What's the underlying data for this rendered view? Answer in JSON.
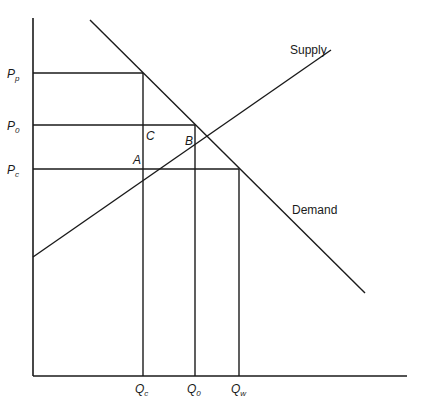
{
  "diagram": {
    "type": "supply-demand price control diagram",
    "curves": {
      "supply": {
        "label": "Supply",
        "from": [
          33,
          257
        ],
        "to": [
          331,
          50
        ]
      },
      "demand": {
        "label": "Demand",
        "from": [
          90,
          20
        ],
        "to": [
          365,
          293
        ]
      }
    },
    "axes": {
      "origin": [
        33,
        376
      ],
      "y_top": 18,
      "x_right": 407
    },
    "price_labels": [
      {
        "id": "Pp",
        "main": "P",
        "sub": "p",
        "y": 73
      },
      {
        "id": "P0",
        "main": "P",
        "sub": "0",
        "y": 125
      },
      {
        "id": "Pc",
        "main": "P",
        "sub": "c",
        "y": 169
      }
    ],
    "quantity_labels": [
      {
        "id": "Qc",
        "main": "Q",
        "sub": "c",
        "x": 143
      },
      {
        "id": "Q0",
        "main": "Q",
        "sub": "0",
        "x": 195
      },
      {
        "id": "Qw",
        "main": "Q",
        "sub": "w",
        "x": 239
      }
    ],
    "region_labels": {
      "A": "A",
      "B": "B",
      "C": "C"
    },
    "supply_label": "Supply",
    "demand_label": "Demand",
    "points": {
      "equilibrium": [
        195,
        125
      ],
      "supply_at_Pc": [
        143,
        169
      ],
      "demand_at_Pp": [
        143,
        73
      ],
      "demand_at_Pc": [
        239,
        169
      ]
    }
  }
}
